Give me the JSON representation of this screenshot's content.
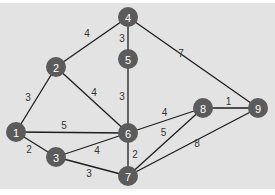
{
  "colors": {
    "background": "#e3e3e3",
    "node_fill": "#5b5b5b",
    "node_text": "#ffffff",
    "edge": "#1e1e1e",
    "weight_text": "#333333"
  },
  "graph": {
    "nodes": [
      {
        "id": "1",
        "label": "1"
      },
      {
        "id": "2",
        "label": "2"
      },
      {
        "id": "3",
        "label": "3"
      },
      {
        "id": "4",
        "label": "4"
      },
      {
        "id": "5",
        "label": "5"
      },
      {
        "id": "6",
        "label": "6"
      },
      {
        "id": "7",
        "label": "7"
      },
      {
        "id": "8",
        "label": "8"
      },
      {
        "id": "9",
        "label": "9"
      }
    ],
    "edges": [
      {
        "from": "1",
        "to": "2",
        "weight": "3"
      },
      {
        "from": "1",
        "to": "6",
        "weight": "5"
      },
      {
        "from": "1",
        "to": "3",
        "weight": "2"
      },
      {
        "from": "2",
        "to": "4",
        "weight": "4"
      },
      {
        "from": "2",
        "to": "6",
        "weight": "4"
      },
      {
        "from": "4",
        "to": "5",
        "weight": "3"
      },
      {
        "from": "5",
        "to": "6",
        "weight": "3"
      },
      {
        "from": "4",
        "to": "9",
        "weight": "7"
      },
      {
        "from": "3",
        "to": "6",
        "weight": "4"
      },
      {
        "from": "3",
        "to": "7",
        "weight": "3"
      },
      {
        "from": "6",
        "to": "7",
        "weight": "2"
      },
      {
        "from": "6",
        "to": "8",
        "weight": "4"
      },
      {
        "from": "8",
        "to": "9",
        "weight": "1"
      },
      {
        "from": "7",
        "to": "8",
        "weight": "5"
      },
      {
        "from": "7",
        "to": "9",
        "weight": "8"
      }
    ]
  }
}
